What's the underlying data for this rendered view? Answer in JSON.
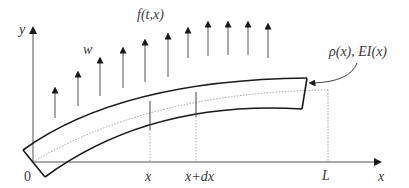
{
  "diagram": {
    "axes": {
      "y_label": "y",
      "x_label": "x",
      "origin_label": "0"
    },
    "load": {
      "label": "f(t,x)",
      "arrow_count": 11
    },
    "deflection_label": "w",
    "properties_label": "ρ(x), EI(x)",
    "section": {
      "start_label": "x",
      "end_label": "x+dx"
    },
    "length_label": "L",
    "colors": {
      "beam_edge": "#1a1a1a",
      "axis": "#3a3a3a",
      "arrow": "#3a3a3a",
      "dotted_line": "#9a9a9a"
    }
  }
}
